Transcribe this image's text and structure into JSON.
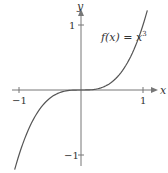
{
  "chart_data": {
    "type": "line",
    "title": "",
    "annotation": "f(x) = x³",
    "annotation_parts": {
      "lhs": "f(x) = x",
      "exp": "3"
    },
    "xlabel": "x",
    "ylabel": "y",
    "xlim": [
      -1.1,
      1.1
    ],
    "ylim": [
      -1.1,
      1.2
    ],
    "x_ticks": [
      {
        "value": -1,
        "label": "−1"
      },
      {
        "value": 1,
        "label": "1"
      }
    ],
    "y_ticks": [
      {
        "value": 1,
        "label": "1"
      },
      {
        "value": -1,
        "label": "−1"
      }
    ],
    "grid": false,
    "legend": "none",
    "series": [
      {
        "name": "f(x) = x^3",
        "x": [
          -1.07,
          -1.0,
          -0.8,
          -0.6,
          -0.4,
          -0.2,
          0,
          0.2,
          0.4,
          0.6,
          0.8,
          1.0,
          1.07
        ],
        "y": [
          -1.225,
          -1.0,
          -0.512,
          -0.216,
          -0.064,
          -0.008,
          0,
          0.008,
          0.064,
          0.216,
          0.512,
          1.0,
          1.225
        ]
      }
    ],
    "colors": {
      "curve": "#555555",
      "axes": "#777777",
      "text": "#333333"
    }
  }
}
